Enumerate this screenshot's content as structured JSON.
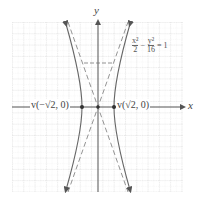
{
  "diagram": {
    "type": "hyperbola-graph",
    "equation": {
      "text": "x²/2 − y²/16 = 1",
      "term1_num": "x²",
      "term1_den": "2",
      "minus": "−",
      "term2_num": "y²",
      "term2_den": "16",
      "equals": "= 1"
    },
    "axes": {
      "x_label": "x",
      "y_label": "y"
    },
    "vertices": [
      {
        "label": "v(−√2, 0)",
        "x": -1.414,
        "y": 0
      },
      {
        "label": "v(√2, 0)",
        "x": 1.414,
        "y": 0
      }
    ],
    "asymptotes": [
      "y = 2√2·x",
      "y = −2√2·x"
    ],
    "grid": {
      "x_range": [
        -7.5,
        7.5
      ],
      "y_range": [
        -7.5,
        7.5
      ],
      "unit_px": 11.3
    },
    "colors": {
      "curve": "#666666",
      "axis": "#555555",
      "grid": "#cccccc",
      "asymptote": "#777777"
    }
  }
}
